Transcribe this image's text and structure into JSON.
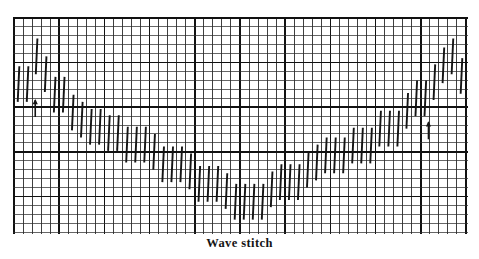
{
  "figure": {
    "caption": "Wave stitch",
    "type": "needlework-stitch-diagram",
    "medium": "canvas grid chart"
  },
  "grid": {
    "x": 14,
    "y": 18,
    "cols": 50,
    "rows": 24,
    "cell_w": 9.04,
    "cell_h": 8.92,
    "minor_color": "#2b2b2b",
    "major_color": "#111111",
    "minor_width": 0.9,
    "major_width": 1.7,
    "major_every_col": 5,
    "major_every_row": 5,
    "background": "#ffffff"
  },
  "stitch_style": {
    "color": "#141414",
    "width": 1.9,
    "span_rows": 4,
    "slant_cells": 0.18,
    "cap": "butt"
  },
  "arrows": [
    {
      "name": "start-arrow-left",
      "col": 2.35,
      "row_base": 11.1,
      "height_rows": 1.9
    },
    {
      "name": "start-arrow-right",
      "col": 45.85,
      "row_base": 13.6,
      "height_rows": 1.9
    }
  ],
  "chart_data": {
    "type": "stitch-chart",
    "title": "Wave stitch",
    "xlabel": "canvas thread (column)",
    "ylabel": "canvas thread (row)",
    "xlim": [
      0,
      50
    ],
    "ylim": [
      0,
      24
    ],
    "grid": true,
    "legend": false,
    "stitch_span_rows": 4,
    "columns": [
      0,
      1,
      2,
      3,
      4,
      5,
      6,
      7,
      8,
      9,
      10,
      11,
      12,
      13,
      14,
      15,
      16,
      17,
      18,
      19,
      20,
      21,
      22,
      23,
      24,
      25,
      26,
      27,
      28,
      29,
      30,
      31,
      32,
      33,
      34,
      35,
      36,
      37,
      38,
      39,
      40,
      41,
      42,
      43,
      44,
      45,
      46,
      47,
      48,
      49
    ],
    "series": [
      {
        "name": "wave-stitches",
        "note": "Each entry is [column, top_row] of a vertical stitch 4 rows tall; row 0 is the top grid line.",
        "stitches": [
          [
            0,
            5.4
          ],
          [
            1,
            5.4
          ],
          [
            2,
            2.3
          ],
          [
            3,
            4.3
          ],
          [
            4,
            6.6
          ],
          [
            5,
            6.6
          ],
          [
            6,
            8.6
          ],
          [
            7,
            9.4
          ],
          [
            8,
            10.2
          ],
          [
            9,
            10.2
          ],
          [
            10,
            10.9
          ],
          [
            11,
            10.9
          ],
          [
            12,
            12.2
          ],
          [
            13,
            12.2
          ],
          [
            14,
            12.2
          ],
          [
            15,
            13.0
          ],
          [
            16,
            14.4
          ],
          [
            17,
            14.4
          ],
          [
            18,
            14.4
          ],
          [
            19,
            15.2
          ],
          [
            20,
            16.6
          ],
          [
            21,
            16.6
          ],
          [
            22,
            16.6
          ],
          [
            23,
            17.4
          ],
          [
            24,
            18.6
          ],
          [
            25,
            18.6
          ],
          [
            26,
            18.6
          ],
          [
            27,
            18.6
          ],
          [
            28,
            17.2
          ],
          [
            29,
            16.4
          ],
          [
            30,
            16.4
          ],
          [
            31,
            16.4
          ],
          [
            32,
            15.0
          ],
          [
            33,
            14.2
          ],
          [
            34,
            13.4
          ],
          [
            35,
            13.4
          ],
          [
            36,
            13.4
          ],
          [
            37,
            12.3
          ],
          [
            38,
            12.3
          ],
          [
            39,
            12.3
          ],
          [
            40,
            10.4
          ],
          [
            41,
            10.4
          ],
          [
            42,
            10.4
          ],
          [
            43,
            8.4
          ],
          [
            44,
            7.0
          ],
          [
            45,
            7.0
          ],
          [
            46,
            5.2
          ],
          [
            47,
            3.3
          ],
          [
            48,
            2.3
          ],
          [
            49,
            4.5
          ]
        ]
      }
    ]
  }
}
